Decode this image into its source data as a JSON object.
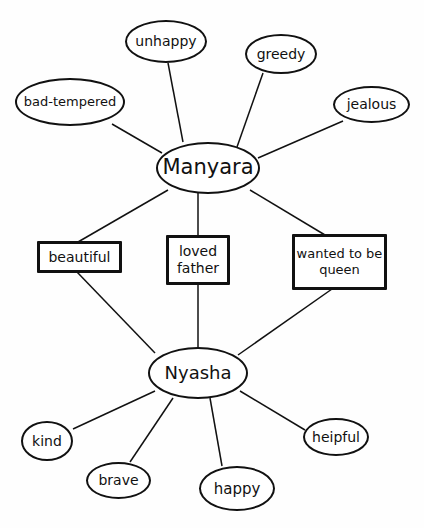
{
  "diagram": {
    "type": "double-bubble-map",
    "colors": {
      "line": "#111111",
      "background": "#fefefe"
    },
    "centers": [
      {
        "id": "manyara",
        "label": "Manyara"
      },
      {
        "id": "nyasha",
        "label": "Nyasha"
      }
    ],
    "manyara_traits": [
      "unhappy",
      "greedy",
      "bad-tempered",
      "jealous"
    ],
    "shared_traits": [
      "beautiful",
      "loved father",
      "wanted to be queen"
    ],
    "nyasha_traits": [
      "kind",
      "brave",
      "happy",
      "heipful"
    ]
  }
}
